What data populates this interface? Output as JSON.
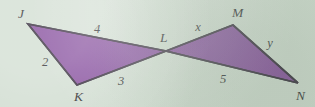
{
  "figure": {
    "kind": "geometry-diagram",
    "background_color": "#cfdccf",
    "fill_color": "#7c3f95",
    "stroke_color": "#241a2b",
    "label_color": "#1b1b22",
    "vertices": [
      {
        "name": "J",
        "label": "J",
        "x": 28,
        "y": 24,
        "label_x": 18,
        "label_y": 18
      },
      {
        "name": "K",
        "label": "K",
        "x": 77,
        "y": 85,
        "label_x": 74,
        "label_y": 101
      },
      {
        "name": "L",
        "label": "L",
        "x": 166,
        "y": 51,
        "label_x": 160,
        "label_y": 42
      },
      {
        "name": "M",
        "label": "M",
        "x": 233,
        "y": 25,
        "label_x": 232,
        "label_y": 17
      },
      {
        "name": "N",
        "label": "N",
        "x": 298,
        "y": 83,
        "label_x": 296,
        "label_y": 100
      }
    ],
    "triangles": [
      {
        "name": "triangle-JKL",
        "points": "28,24 77,85 166,51"
      },
      {
        "name": "triangle-LMN",
        "points": "166,51 233,25 298,83"
      }
    ],
    "side_labels": [
      {
        "name": "side-label-JL",
        "text": "4",
        "x": 97,
        "y": 33,
        "between": "J-L"
      },
      {
        "name": "side-label-JK",
        "text": "2",
        "x": 45,
        "y": 66,
        "between": "J-K"
      },
      {
        "name": "side-label-KL",
        "text": "3",
        "x": 121,
        "y": 85,
        "between": "K-L"
      },
      {
        "name": "side-label-LM",
        "text": "x",
        "x": 198,
        "y": 31,
        "between": "L-M"
      },
      {
        "name": "side-label-MN",
        "text": "y",
        "x": 270,
        "y": 47,
        "between": "M-N"
      },
      {
        "name": "side-label-LN",
        "text": "5",
        "x": 223,
        "y": 83,
        "between": "L-N"
      }
    ]
  }
}
